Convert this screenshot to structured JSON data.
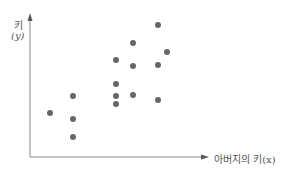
{
  "chart_data": {
    "type": "scatter",
    "title": "",
    "xlabel": "아버지의 키(x)",
    "ylabel": "키",
    "ylabel_sub": "(y)",
    "axis_ticks": false,
    "grid": false,
    "legend": null,
    "point_color": "#666666",
    "axis_color": "#777777",
    "points": [
      {
        "x": 50,
        "y": 113
      },
      {
        "x": 73,
        "y": 96
      },
      {
        "x": 73,
        "y": 119
      },
      {
        "x": 73,
        "y": 137
      },
      {
        "x": 116,
        "y": 60
      },
      {
        "x": 116,
        "y": 84
      },
      {
        "x": 116,
        "y": 96
      },
      {
        "x": 116,
        "y": 104
      },
      {
        "x": 133,
        "y": 43
      },
      {
        "x": 133,
        "y": 66
      },
      {
        "x": 133,
        "y": 95
      },
      {
        "x": 158,
        "y": 25
      },
      {
        "x": 158,
        "y": 65
      },
      {
        "x": 158,
        "y": 100
      },
      {
        "x": 167,
        "y": 52
      }
    ]
  },
  "labels": {
    "y_main": "키",
    "y_sub": "(y)",
    "x": "아버지의 키(x)"
  }
}
